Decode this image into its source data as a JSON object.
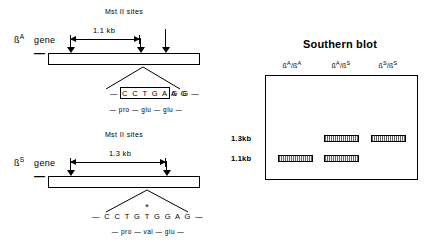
{
  "figure": {
    "left_panel": {
      "beta_a": {
        "mst_header": "Mst II sites",
        "gene_label_base": "ß",
        "gene_label_sup": "A",
        "gene_label_word": "gene",
        "minus_mark": "—",
        "span_label": "1.1 kb",
        "sequence_prefix": "—",
        "sequence_boxed": "C C T G A G G",
        "sequence_suffix": "A G —",
        "amino_acids": "— pro — glu — glu —"
      },
      "beta_s": {
        "mst_header": "Mst II sites",
        "gene_label_base": "ß",
        "gene_label_sup": "S",
        "gene_label_word": "gene",
        "minus_mark": "—",
        "span_label": "1.3 kb",
        "mutation_marker": "*",
        "sequence_full": "— C C T G T G G A G —",
        "amino_acids": "— pro — val — glu —"
      }
    },
    "right_panel": {
      "title": "Southern blot",
      "lanes": [
        {
          "base1": "ß",
          "sup1": "A",
          "sep": "/",
          "base2": "ß",
          "sup2": "A"
        },
        {
          "base1": "ß",
          "sup1": "A",
          "sep": "/",
          "base2": "ß",
          "sup2": "S"
        },
        {
          "base1": "ß",
          "sup1": "S",
          "sep": "/",
          "base2": "ß",
          "sup2": "S"
        }
      ],
      "size_markers": [
        {
          "label": "1.3kb"
        },
        {
          "label": "1.1kb"
        }
      ],
      "bands": [
        {
          "lane": 0,
          "size": "1.1kb"
        },
        {
          "lane": 1,
          "size": "1.3kb"
        },
        {
          "lane": 1,
          "size": "1.1kb"
        },
        {
          "lane": 2,
          "size": "1.3kb"
        }
      ]
    }
  },
  "colors": {
    "ink": "#000000",
    "page": "#ffffff",
    "band_fill": "#f2f2f2"
  }
}
